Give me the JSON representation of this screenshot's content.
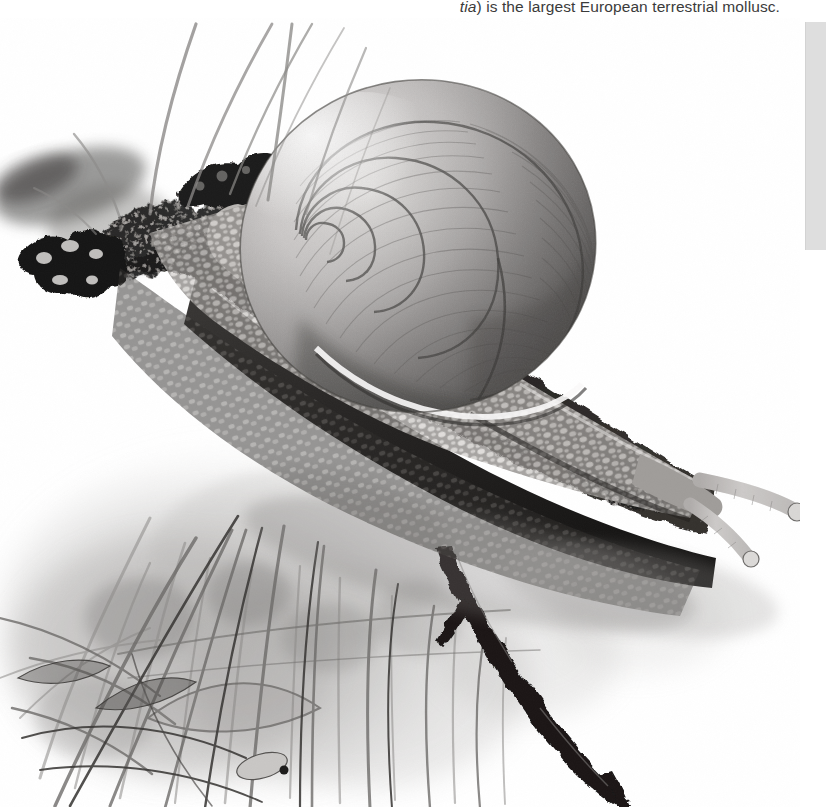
{
  "page": {
    "background_color": "#ffffff",
    "width": 826,
    "height": 807
  },
  "caption": {
    "italic_fragment": "tia",
    "text_after": ") is the largest European terrestrial mollusc.",
    "full_text": "tia) is the largest European terrestrial mollusc.",
    "color": "#3b3b3b",
    "align": "right"
  },
  "sidebar_marker": {
    "label": "",
    "color": "#dedede"
  },
  "illustration": {
    "title": "Roman snail on a mossy branch",
    "medium": "graphite pencil and wash drawing",
    "palette": {
      "white": "#ffffff",
      "paper_tint": "#f7f7f7",
      "light_grey": "#d8d8d8",
      "mid_grey": "#9a9a9a",
      "dark_grey": "#5a5a5a",
      "near_black": "#2a2a2a",
      "black": "#141414"
    },
    "subjects": [
      {
        "name": "snail-shell",
        "description": "large spiral whorled shell with fine growth striations"
      },
      {
        "name": "snail-body",
        "description": "pebbled tuberculate foot and mantle"
      },
      {
        "name": "snail-tentacles",
        "description": "two long eye stalks with bulbous tips pointing right"
      },
      {
        "name": "mossy-branch",
        "description": "dark lichen covered branch crossing diagonally"
      },
      {
        "name": "hanging-twig",
        "description": "dark forked twig descending to lower right"
      },
      {
        "name": "grass-tufts",
        "description": "washed grass blades filling lower left"
      }
    ]
  }
}
